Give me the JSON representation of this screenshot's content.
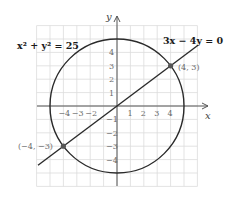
{
  "diagram": {
    "type": "coordinate-plane",
    "axes": {
      "x_label": "x",
      "y_label": "y",
      "x_range": [
        -6,
        6
      ],
      "y_range": [
        -6,
        6
      ]
    },
    "x_ticks": [
      "-4",
      "-3",
      "-2",
      "1",
      "2",
      "3",
      "4"
    ],
    "x_tick_values": [
      -4,
      -3,
      -2,
      1,
      2,
      3,
      4
    ],
    "y_ticks": [
      "4",
      "3",
      "2",
      "1",
      "-1",
      "-2",
      "-3",
      "-4"
    ],
    "y_tick_values": [
      4,
      3,
      2,
      1,
      -1,
      -2,
      -3,
      -4
    ],
    "circle": {
      "equation": "x² + y² = 25",
      "radius": 5,
      "center": [
        0,
        0
      ]
    },
    "line": {
      "equation": "3x − 4y = 0",
      "slope": 0.75
    },
    "points": [
      {
        "label": "(4, 3)",
        "x": 4,
        "y": 3
      },
      {
        "label": "(−4, −3)",
        "x": -4,
        "y": -3
      }
    ],
    "colors": {
      "grid": "#dcdcdc",
      "curve": "#2a2a2a",
      "label": "#6b6b6b"
    }
  }
}
